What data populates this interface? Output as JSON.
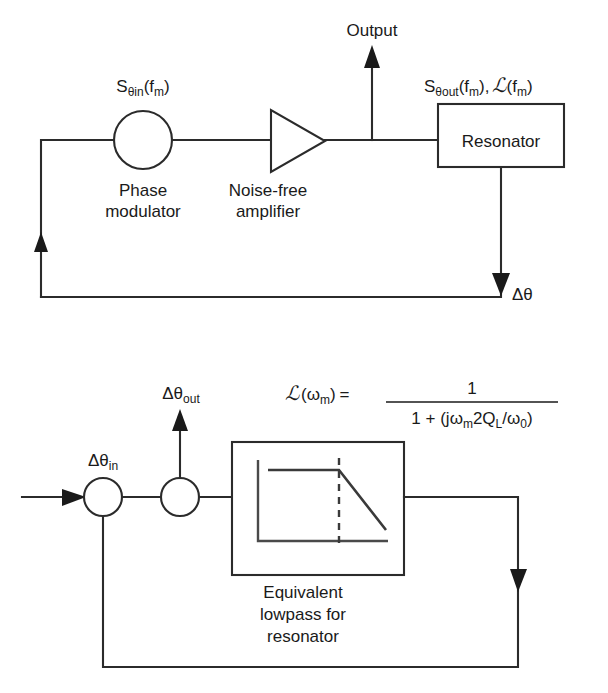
{
  "figure": {
    "background_color": "#ffffff",
    "line_color": "#2b2b2b"
  },
  "top_diagram": {
    "name": "oscillator-feedback-loop",
    "input_spectrum_label": {
      "base": "S",
      "subscript": "θin",
      "argument": "(f",
      "arg_subscript": "m",
      "arg_close": ")",
      "full": "Sθin (fm)"
    },
    "phase_modulator": {
      "label_line1": "Phase",
      "label_line2": "modulator",
      "shape": "circle"
    },
    "amplifier": {
      "label_line1": "Noise-free",
      "label_line2": "amplifier",
      "shape": "triangle"
    },
    "output_label": "Output",
    "output_spectrum_label": {
      "base": "S",
      "subscript": "θout",
      "argument": "(f",
      "arg_subscript": "m",
      "arg_close": "),",
      "script_l": "ℒ",
      "script_arg": "(f",
      "script_arg_sub": "m",
      "script_arg_close": ")",
      "full": "Sθout (fm), ℒ(fm)"
    },
    "resonator": {
      "label": "Resonator",
      "shape": "rectangle"
    },
    "feedback_label": {
      "base": "Δθ",
      "full": "Δθ"
    }
  },
  "equation": {
    "lhs_script": "ℒ",
    "lhs_arg_open": "(ω",
    "lhs_arg_sub": "m",
    "lhs_arg_close": ")",
    "equals": "=",
    "numerator": "1",
    "denominator_part1": "1 + (jω",
    "denominator_sub1": "m",
    "denominator_part2": "2Q",
    "denominator_sub2": "L",
    "denominator_part3": "/ω",
    "denominator_sub3": "0",
    "denominator_part4": ")",
    "full": "ℒ(ωm) = 1 / (1 + (jωm2QL/ω0))"
  },
  "bottom_diagram": {
    "name": "equivalent-lowpass-loop",
    "input_label": {
      "base": "Δθ",
      "subscript": "in",
      "full": "Δθin"
    },
    "output_label": {
      "base": "Δθ",
      "subscript": "out",
      "full": "Δθout"
    },
    "lowpass_block": {
      "label_line1": "Equivalent",
      "label_line2": "lowpass for",
      "label_line3": "resonator",
      "shape": "rectangle-with-response-plot"
    },
    "response_plot": {
      "type": "line",
      "description": "lowpass magnitude response: flat passband then roll-off",
      "corner_marker": "dashed vertical line at corner frequency",
      "passband_level": 1,
      "rolloff_slope": "negative"
    }
  },
  "icons": {
    "arrow_up": "arrow-up-icon",
    "arrow_down": "arrow-down-icon",
    "arrow_right": "arrow-right-icon",
    "summing_node": "summing-node-icon"
  }
}
